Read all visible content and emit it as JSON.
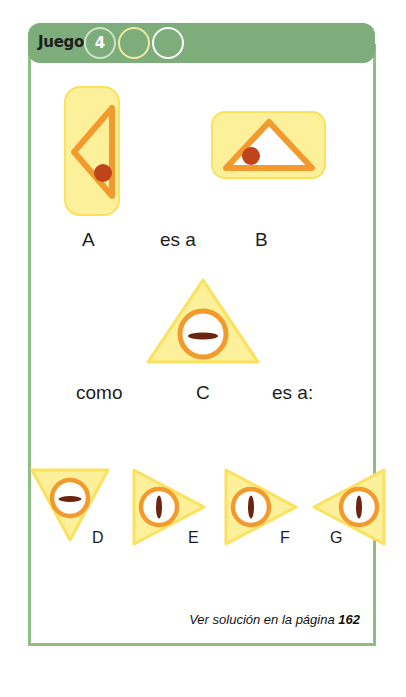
{
  "header": {
    "label": "Juego",
    "badge_number": "4",
    "circles": [
      {
        "name": "circle-filled-number",
        "outline_color": "#cfe3c9"
      },
      {
        "name": "circle-yellow",
        "outline_color": "#f3eaa0"
      },
      {
        "name": "circle-white",
        "outline_color": "#ffffff"
      }
    ]
  },
  "analogy": {
    "row1": {
      "left_label": "A",
      "relation": "es a",
      "right_label": "B"
    },
    "row2": {
      "connector": "como",
      "middle_label": "C",
      "relation": "es a:"
    }
  },
  "options": [
    {
      "label": "D",
      "orientation": "down",
      "bar": "horizontal"
    },
    {
      "label": "E",
      "orientation": "right",
      "bar": "vertical"
    },
    {
      "label": "F",
      "orientation": "right",
      "bar": "vertical"
    },
    {
      "label": "G",
      "orientation": "left",
      "bar": "vertical"
    }
  ],
  "shapes": {
    "a": {
      "card": "vertical-rounded-rect",
      "triangle": "left-pointing-outline",
      "marker": "dot"
    },
    "b": {
      "card": "horizontal-rounded-rect",
      "triangle": "up-pointing-outline",
      "marker": "dot"
    },
    "c": {
      "triangle": "up-pointing-filled",
      "marker": "circle-with-horizontal-bar"
    }
  },
  "footer": {
    "text_prefix": "Ver solución en la página ",
    "page_number": "162"
  },
  "colors": {
    "frame_green": "#8fbd84",
    "header_green": "#7cad7b",
    "yellow_fill": "#fdf09a",
    "yellow_stroke": "#fbe15e",
    "orange": "#f29a2e",
    "dot_red": "#c0441a",
    "bar_dark": "#6b2410"
  }
}
